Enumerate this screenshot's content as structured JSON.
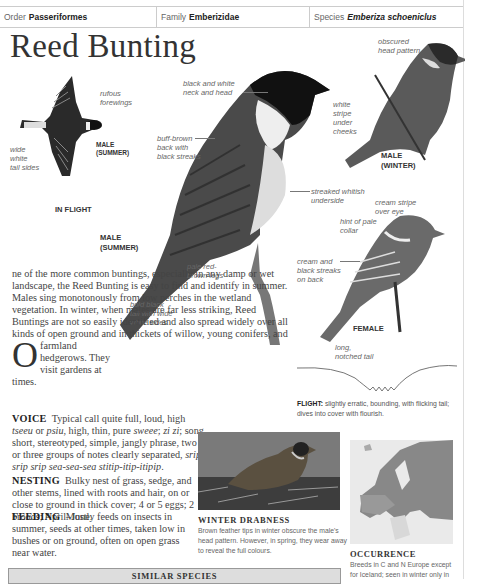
{
  "header": {
    "order_label": "Order",
    "order_value": "Passeriformes",
    "family_label": "Family",
    "family_value": "Emberizidae",
    "species_label": "Species",
    "species_value": "Emberiza schoeniclus"
  },
  "title": "Reed Bunting",
  "illustrations": {
    "in_flight": {
      "caption": "IN FLIGHT",
      "sub_caption_1": "MALE",
      "sub_caption_2": "(SUMMER)",
      "labels": {
        "rufous": [
          "rufous",
          "forewings"
        ],
        "tail": [
          "wide",
          "white",
          "tail sides"
        ]
      }
    },
    "male_summer": {
      "caption_1": "MALE",
      "caption_2": "(SUMMER)",
      "labels": {
        "neck": [
          "black and white",
          "neck and head"
        ],
        "back": [
          "buff-brown",
          "back with",
          "black streaks"
        ],
        "cheeks": [
          "white",
          "stripe",
          "under",
          "cheeks"
        ],
        "underside": [
          "streaked whitish",
          "underside"
        ],
        "legs": [
          "pale red-",
          "brown legs"
        ],
        "tail": [
          "bold black",
          "tail with wide",
          "white sides"
        ]
      }
    },
    "male_winter": {
      "caption_1": "MALE",
      "caption_2": "(WINTER)",
      "labels": {
        "head": [
          "obscured",
          "head pattern"
        ]
      }
    },
    "female": {
      "caption": "FEMALE",
      "labels": {
        "eye": [
          "cream stripe",
          "over eye"
        ],
        "collar": [
          "hint of pale",
          "collar"
        ],
        "back": [
          "cream and",
          "black streaks",
          "on back"
        ],
        "tail": [
          "long,",
          "notched tail"
        ]
      }
    }
  },
  "intro": {
    "dropcap": "O",
    "text": "ne of the more common buntings, especially in any damp or wet landscape, the Reed Bunting is easy to find and identify in summer. Males sing monotonously from low perches in the wetland vegetation. In winter, when males are far less striking, Reed Buntings are not so easily identified and also spread widely over all kinds of open ground and in thickets of willow, young conifers, and farmland hedgerows. They visit gardens at times."
  },
  "voice": {
    "label": "VOICE",
    "text_1": "Typical call quite full, loud, high ",
    "call_1": "tseeu",
    "text_2": " or ",
    "call_2": "psiu",
    "text_3": ", high, thin, pure ",
    "call_3": "sweee",
    "text_4": "; ",
    "call_4": "zi zi",
    "text_5": "; song short, stereotyped, simple, jangly phrase, two or three groups of notes clearly separated, ",
    "song": "srip srip srip sea-sea-sea stitip-itip-itipip",
    "text_6": "."
  },
  "nesting": {
    "label": "NESTING",
    "text": "Bulky nest of grass, sedge, and other stems, lined with roots and hair, on or close to ground in thick cover; 4 or 5 eggs; 2 broods; April–June."
  },
  "feeding": {
    "label": "FEEDING",
    "text": "Mostly feeds on insects in summer, seeds at other times, taken low in bushes or on ground, often on open grass near water."
  },
  "flight": {
    "label": "FLIGHT:",
    "text": "slightly erratic, bounding, with flicking tail; dives into cover with flourish."
  },
  "photo": {
    "title": "WINTER DRABNESS",
    "caption": "Brown feather tips in winter obscure the male's head pattern. However, in spring, they wear away to reveal the full colours."
  },
  "occurrence": {
    "title": "OCCURRENCE",
    "text": "Breeds in C and N Europe except for Iceland; seen in winter only in"
  },
  "similar_species": {
    "title": "SIMILAR SPECIES"
  }
}
